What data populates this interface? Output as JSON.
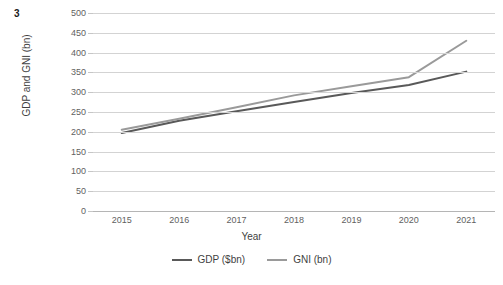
{
  "figure": {
    "label": "3"
  },
  "chart_data": {
    "type": "line",
    "title": "",
    "xlabel": "Year",
    "ylabel": "GDP and GNI (bn)",
    "categories": [
      "2015",
      "2016",
      "2017",
      "2018",
      "2019",
      "2020",
      "2021"
    ],
    "x": [
      2015,
      2016,
      2017,
      2018,
      2019,
      2020,
      2021
    ],
    "series": [
      {
        "name": "GDP ($bn)",
        "color": "#595959",
        "values": [
          197,
          228,
          252,
          275,
          298,
          318,
          352
        ]
      },
      {
        "name": "GNI (bn)",
        "color": "#9a9a9a",
        "values": [
          205,
          233,
          262,
          292,
          315,
          338,
          430
        ]
      }
    ],
    "ylim": [
      0,
      500
    ],
    "yticks": [
      0,
      50,
      100,
      150,
      200,
      250,
      300,
      350,
      400,
      450,
      500
    ],
    "ytick_labels": [
      "0",
      "50",
      "100",
      "150",
      "200",
      "250",
      "300",
      "350",
      "400",
      "450",
      "500"
    ],
    "grid": true,
    "grid_axis": "y",
    "grid_color": "#d3d3d3",
    "legend_position": "bottom",
    "markers": false,
    "line_width": 2
  }
}
